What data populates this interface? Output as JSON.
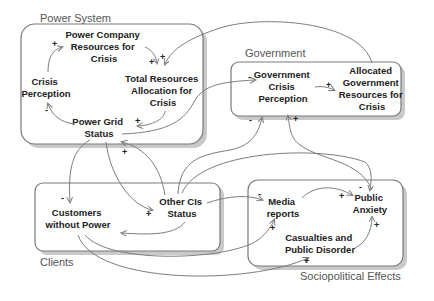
{
  "groups": {
    "power_system": "Power System",
    "government": "Government",
    "clients": "Clients",
    "sociopolitical": "Sociopolitical Effects"
  },
  "nodes": {
    "power_company": [
      "Power Company",
      "Resources for",
      "Crisis"
    ],
    "total_resources": [
      "Total Resources",
      "Allocation for",
      "Crisis"
    ],
    "crisis_perception": [
      "Crisis",
      "Perception"
    ],
    "power_grid": [
      "Power Grid",
      "Status"
    ],
    "gov_perception": [
      "Government",
      "Crisis",
      "Perception"
    ],
    "allocated_gov": [
      "Allocated",
      "Government",
      "Resources for",
      "Crisis"
    ],
    "customers": [
      "Customers",
      "without Power"
    ],
    "other_cis": [
      "Other CIs",
      "Status"
    ],
    "media": [
      "Media",
      "reports"
    ],
    "public_anxiety": [
      "Public",
      "Anxiety"
    ],
    "casualties": [
      "Casualties and",
      "Public Disorder"
    ]
  },
  "signs": {
    "crisis_to_company": "+",
    "company_to_total": "+",
    "allocated_to_total": "+",
    "total_to_grid": "+",
    "grid_to_perception": "-",
    "grid_to_gov": "-",
    "govperc_to_allocated": "+",
    "cis_to_gov": "-",
    "anxiety_to_gov": "+",
    "cis_to_grid": "+",
    "grid_to_customers": "-",
    "grid_to_cis": "+",
    "cis_to_media": "-",
    "media_to_anxiety": "+",
    "cis_to_anxiety": "-",
    "customers_to_media": "+",
    "casualties_to_anxiety": "+",
    "customers_to_casualties": "+"
  }
}
